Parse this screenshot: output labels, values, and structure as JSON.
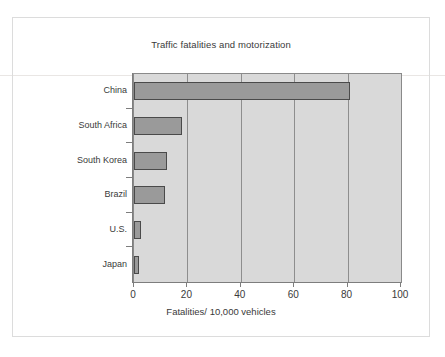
{
  "chart_data": {
    "type": "bar",
    "orientation": "horizontal",
    "title": "Traffic fatalities and motorization",
    "xlabel": "Fatalities/ 10,000 vehicles",
    "ylabel": "",
    "categories": [
      "China",
      "South Africa",
      "South Korea",
      "Brazil",
      "U.S.",
      "Japan"
    ],
    "values": [
      81,
      18,
      12.5,
      11.5,
      2.5,
      1.8
    ],
    "series": [
      {
        "name": "Fatalities per 10,000 vehicles",
        "values": [
          81,
          18,
          12.5,
          11.5,
          2.5,
          1.8
        ]
      }
    ],
    "xlim": [
      0,
      100
    ],
    "xticks": [
      "0",
      "20",
      "40",
      "60",
      "80",
      "100"
    ],
    "xtick_values": [
      0,
      20,
      40,
      60,
      80,
      100
    ],
    "grid": "vertical",
    "legend": "none",
    "plot_background_color": "#d9d9d9",
    "bar_color": "#9a9a9a",
    "bar_border_color": "#4a4a4a",
    "gridline_color": "#8e8e8e",
    "axis_color": "#7d7d7d",
    "text_color": "#3a3a3a"
  },
  "figure": {
    "frame_color": "#dcdcdc"
  }
}
